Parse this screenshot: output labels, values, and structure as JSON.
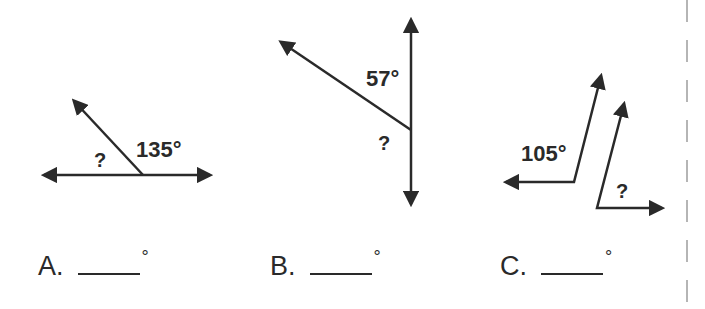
{
  "problems": [
    {
      "id": "A",
      "given_angle": "135°",
      "unknown_label": "?",
      "answer_letter": "A.",
      "answer_value": "",
      "degree_symbol": "°"
    },
    {
      "id": "B",
      "given_angle": "57°",
      "unknown_label": "?",
      "answer_letter": "B.",
      "answer_value": "",
      "degree_symbol": "°"
    },
    {
      "id": "C",
      "given_angle": "105°",
      "unknown_label": "?",
      "answer_letter": "C.",
      "answer_value": "",
      "degree_symbol": "°"
    }
  ],
  "colors": {
    "ink": "#2a2a2a",
    "cutline": "#b5b5b5",
    "background": "#ffffff"
  }
}
